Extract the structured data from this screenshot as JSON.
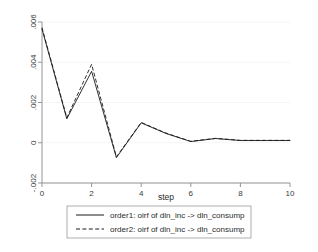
{
  "chart_data": {
    "type": "line",
    "title": "",
    "subtitle": "",
    "xlabel": "step",
    "ylabel": "",
    "x": [
      0,
      1,
      2,
      3,
      4,
      5,
      6,
      7,
      8,
      9,
      10
    ],
    "xlim": [
      0,
      10
    ],
    "ylim": [
      -0.002,
      0.006
    ],
    "xticks": [
      "0",
      "2",
      "4",
      "6",
      "8",
      "10"
    ],
    "xtick_values": [
      0,
      2,
      4,
      6,
      8,
      10
    ],
    "yticks": [
      "-.002",
      "0",
      ".002",
      ".004",
      ".006"
    ],
    "ytick_values": [
      -0.002,
      0,
      0.002,
      0.004,
      0.006
    ],
    "grid": true,
    "legend_position": "bottom",
    "series": [
      {
        "name": "order1: oirf of dln_inc -> dln_consump",
        "style": "solid",
        "color": "#1a1a1a",
        "values": [
          0.00565,
          0.00119,
          0.00355,
          -0.00074,
          0.00099,
          0.00046,
          6e-05,
          0.00021,
          0.00011,
          0.00011,
          0.00011
        ]
      },
      {
        "name": "order2: oirf of dln_inc -> dln_consump",
        "style": "dashed",
        "color": "#1a1a1a",
        "values": [
          0.00572,
          0.00124,
          0.0039,
          -0.0007,
          0.00101,
          0.00048,
          7e-05,
          0.00022,
          0.00012,
          0.00012,
          0.00012
        ]
      }
    ]
  },
  "legend": {
    "entries": [
      {
        "label": "order1: oirf of dln_inc -> dln_consump",
        "style": "solid"
      },
      {
        "label": "order2: oirf of dln_inc -> dln_consump",
        "style": "dashed"
      }
    ]
  },
  "axes": {
    "x_title": "step",
    "y_title": ""
  }
}
